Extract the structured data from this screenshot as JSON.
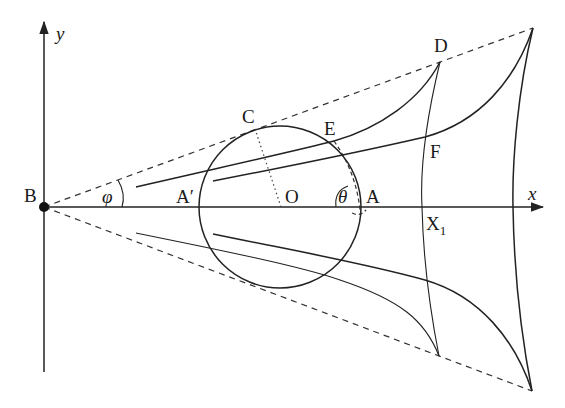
{
  "figure": {
    "labels": {
      "y_axis": "y",
      "x_axis": "x",
      "B": "B",
      "C": "C",
      "D": "D",
      "E": "E",
      "F": "F",
      "O": "O",
      "A": "A",
      "A_prime": "A′",
      "X1_main": "X",
      "X1_sub": "1",
      "phi": "φ",
      "theta": "θ"
    },
    "elements": [
      "y-axis",
      "x-axis",
      "point B (filled)",
      "circle centered O",
      "upper tangent line B–C–apex (dashed)",
      "lower tangent line B–apex (dashed)",
      "radius O–C (dotted)",
      "arc E–A (dashed)",
      "upper curve through A′, E, to D",
      "upper curve through F to apex",
      "lower mirrored curves",
      "curve D–X1–D′",
      "right boundary curve",
      "angle marks φ and θ"
    ]
  }
}
